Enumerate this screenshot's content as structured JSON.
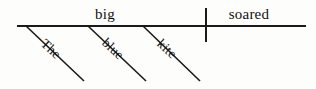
{
  "diagram": {
    "type": "reed-kellogg-sentence-diagram",
    "sentence": "The big blue kite soared.",
    "background_color": "#fdfdfb",
    "ink_color": "#1a1a1a",
    "baseline": {
      "name": "main-baseline",
      "x1": 17,
      "y1": 26,
      "x2": 306,
      "y2": 26
    },
    "subject_predicate_divider": {
      "name": "subject-predicate-divider",
      "x": 206,
      "y1": 8,
      "y2": 42
    },
    "baseline_words": [
      {
        "label": "big",
        "role": "subject",
        "x": 105,
        "y": 19
      },
      {
        "label": "soared",
        "role": "verb",
        "x": 249,
        "y": 19
      }
    ],
    "modifier_lines": [
      {
        "label": "The",
        "role": "article-modifier",
        "x1": 26,
        "y1": 26,
        "x2": 84,
        "y2": 81,
        "text_x": 48,
        "text_y": 52,
        "angle": 43
      },
      {
        "label": "blue",
        "role": "adjective-modifier",
        "x1": 88,
        "y1": 26,
        "x2": 146,
        "y2": 81,
        "text_x": 110,
        "text_y": 52,
        "angle": 43
      },
      {
        "label": "kite",
        "role": "noun-modifier",
        "x1": 143,
        "y1": 26,
        "x2": 200,
        "y2": 81,
        "text_x": 164,
        "text_y": 52,
        "angle": 43
      }
    ]
  }
}
